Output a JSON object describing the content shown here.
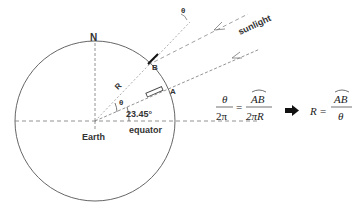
{
  "diagram": {
    "labels": {
      "north": "N",
      "point_a": "A",
      "point_b": "B",
      "radius": "R",
      "angle_center": "θ",
      "angle_sun": "θ",
      "tilt_angle": "23.45°",
      "earth": "Earth",
      "equator": "equator",
      "sunlight": "sunlight"
    },
    "formula": {
      "lhs_num": "θ",
      "lhs_den": "2π",
      "equals": "=",
      "rhs_num": "AB",
      "rhs_den": "2πR",
      "implies_icon": "right-arrow-icon",
      "result_lhs": "R",
      "result_num": "AB",
      "result_den": "θ"
    },
    "colors": {
      "line": "#555555",
      "dashed": "#777777",
      "text": "#333333",
      "gnomon_b": "#111111"
    }
  }
}
